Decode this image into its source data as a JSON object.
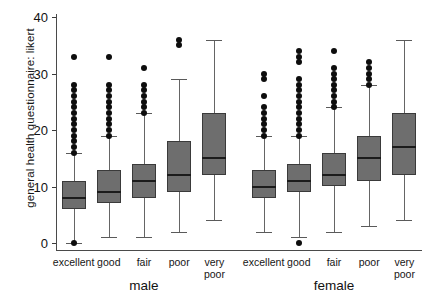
{
  "chart_data": {
    "type": "box",
    "title": "",
    "xlabel": "",
    "ylabel": "general health questionnaire: likert",
    "ylim": [
      0,
      41
    ],
    "yticks": [
      0,
      10,
      20,
      30,
      40
    ],
    "ytick_labels": [
      "0",
      "10",
      "20",
      "30",
      "40"
    ],
    "grid": false,
    "legend": false,
    "group_labels": [
      "male",
      "female"
    ],
    "categories": [
      "excellent",
      "good",
      "fair",
      "poor",
      "very poor"
    ],
    "boxes": [
      {
        "group": "male",
        "category": "excellent",
        "q1": 6,
        "median": 8,
        "q3": 11,
        "whisker_low": 0,
        "whisker_high": 16,
        "outliers": [
          0,
          16,
          17,
          18,
          19,
          20,
          21,
          22,
          23,
          24,
          25,
          26,
          27,
          28,
          33
        ]
      },
      {
        "group": "male",
        "category": "good",
        "q1": 7,
        "median": 9,
        "q3": 13,
        "whisker_low": 1,
        "whisker_high": 19,
        "outliers": [
          19,
          20,
          21,
          22,
          23,
          24,
          25,
          26,
          27,
          28,
          33
        ]
      },
      {
        "group": "male",
        "category": "fair",
        "q1": 8,
        "median": 11,
        "q3": 14,
        "whisker_low": 1,
        "whisker_high": 23,
        "outliers": [
          23,
          24,
          25,
          26,
          27,
          28,
          31
        ]
      },
      {
        "group": "male",
        "category": "poor",
        "q1": 9,
        "median": 12,
        "q3": 18,
        "whisker_low": 2,
        "whisker_high": 29,
        "outliers": [
          35,
          36
        ]
      },
      {
        "group": "male",
        "category": "very poor",
        "q1": 12,
        "median": 15,
        "q3": 23,
        "whisker_low": 4,
        "whisker_high": 36,
        "outliers": []
      },
      {
        "group": "female",
        "category": "excellent",
        "q1": 8,
        "median": 10,
        "q3": 13,
        "whisker_low": 2,
        "whisker_high": 19,
        "outliers": [
          19,
          20,
          21,
          22,
          23,
          24,
          26,
          29,
          30
        ]
      },
      {
        "group": "female",
        "category": "good",
        "q1": 9,
        "median": 11,
        "q3": 14,
        "whisker_low": 1,
        "whisker_high": 19,
        "outliers": [
          0,
          19,
          20,
          21,
          22,
          23,
          24,
          25,
          26,
          27,
          28,
          29,
          32,
          33,
          34
        ]
      },
      {
        "group": "female",
        "category": "fair",
        "q1": 10,
        "median": 12,
        "q3": 16,
        "whisker_low": 2,
        "whisker_high": 24,
        "outliers": [
          24,
          25,
          26,
          27,
          28,
          29,
          30,
          31,
          34
        ]
      },
      {
        "group": "female",
        "category": "poor",
        "q1": 11,
        "median": 15,
        "q3": 19,
        "whisker_low": 3,
        "whisker_high": 28,
        "outliers": [
          28,
          29,
          30,
          31,
          32
        ]
      },
      {
        "group": "female",
        "category": "very poor",
        "q1": 12,
        "median": 17,
        "q3": 23,
        "whisker_low": 4,
        "whisker_high": 36,
        "outliers": []
      }
    ]
  },
  "colors": {
    "box_fill": "#6e6e6e",
    "box_stroke": "#3a3a3a",
    "median": "#1b1b1b",
    "whisker": "#656565",
    "outlier": "#0d0d0d",
    "axis": "#4a4a4a",
    "text": "#121212",
    "background": "#ffffff"
  }
}
